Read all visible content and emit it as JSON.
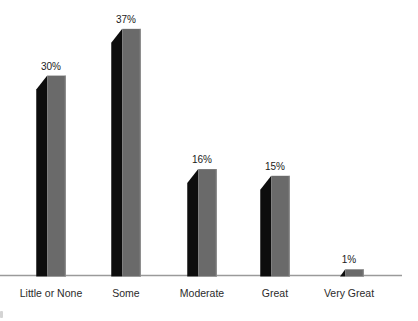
{
  "chart_data": {
    "type": "bar",
    "title": "",
    "xlabel": "",
    "ylabel": "",
    "categories": [
      "Little or None",
      "Some",
      "Moderate",
      "Great",
      "Very Great"
    ],
    "values": [
      30,
      37,
      16,
      15,
      1
    ],
    "value_labels": [
      "30%",
      "37%",
      "16%",
      "15%",
      "1%"
    ],
    "unit": "percent",
    "ylim": [
      0,
      40
    ],
    "grid": false,
    "legend": false,
    "axes_shown": [
      "x"
    ],
    "bar_style": "3d-extruded",
    "colors": {
      "bar_shadow_face": "#0d0d0d",
      "bar_front_face": "#6a6a6a",
      "bar_front_edge": "#8f8f8f",
      "axis_line": "#9a9a9a",
      "value_label": "#1a1a1a",
      "category_label": "#2b2b2b",
      "background": "#ffffff"
    }
  }
}
